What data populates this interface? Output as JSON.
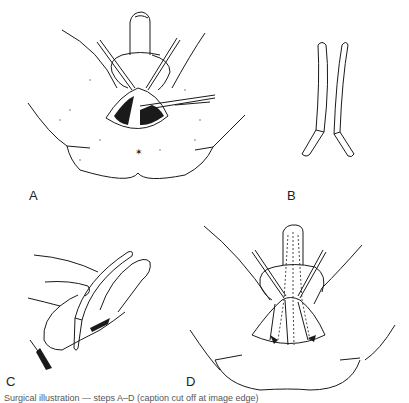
{
  "figure": {
    "panels": [
      {
        "id": "A",
        "label": "A",
        "description": "Perineal view: exposure with retractors and forceps, incision opened"
      },
      {
        "id": "B",
        "label": "B",
        "description": "Pair of curved sounds / sounds instrument"
      },
      {
        "id": "C",
        "label": "C",
        "description": "Lateral view: hand holding sound introduced along penis"
      },
      {
        "id": "D",
        "label": "D",
        "description": "Perineal view: closure with dashed-line course of instrument"
      }
    ],
    "caption": "Surgical illustration — steps A–D (caption cut off at image edge)"
  },
  "colors": {
    "ink": "#1a1a1a",
    "background": "#ffffff"
  }
}
